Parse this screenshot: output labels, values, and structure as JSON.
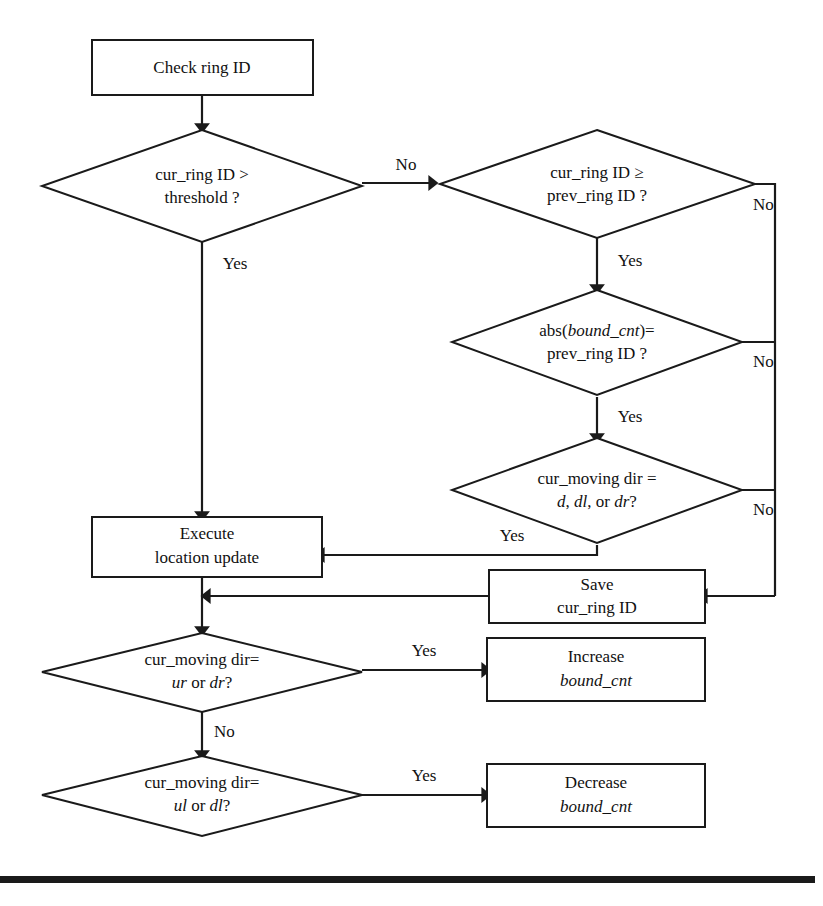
{
  "diagram": {
    "kind": "flowchart",
    "background_color": "#ffffff",
    "line_color": "#1a1a1a",
    "text_color": "#111111",
    "nodes": {
      "check_ring_id": {
        "type": "process",
        "line1": "Check ring ID"
      },
      "cur_ring_gt_threshold": {
        "type": "decision",
        "line1": "cur_ring ID >",
        "line2": "threshold ?"
      },
      "cur_ring_ge_prev_ring": {
        "type": "decision",
        "line1": "cur_ring ID ≥",
        "line2": "prev_ring ID ?"
      },
      "abs_bound_cnt_eq_prev": {
        "type": "decision",
        "line1_a": "abs(",
        "line1_b": "bound_cnt",
        "line1_c": ")=",
        "line2": "prev_ring ID ?"
      },
      "cur_moving_dir_d_dl_dr": {
        "type": "decision",
        "line1": "cur_moving dir =",
        "line2_a": "d",
        "line2_b": ", ",
        "line2_c": "dl",
        "line2_d": ", or ",
        "line2_e": "dr",
        "line2_f": "?"
      },
      "execute_location_update": {
        "type": "process",
        "line1": "Execute",
        "line2": "location update"
      },
      "save_cur_ring_id": {
        "type": "process",
        "line1": "Save",
        "line2": "cur_ring ID"
      },
      "cur_moving_dir_ur_dr": {
        "type": "decision",
        "line1": "cur_moving dir=",
        "line2_a": "ur",
        "line2_b": " or ",
        "line2_c": "dr",
        "line2_d": "?"
      },
      "increase_bound_cnt": {
        "type": "process",
        "line1": "Increase",
        "line2": "bound_cnt"
      },
      "cur_moving_dir_ul_dl": {
        "type": "decision",
        "line1": "cur_moving dir=",
        "line2_a": "ul",
        "line2_b": " or ",
        "line2_c": "dl",
        "line2_d": "?"
      },
      "decrease_bound_cnt": {
        "type": "process",
        "line1": "Decrease",
        "line2": "bound_cnt"
      }
    },
    "edge_labels": {
      "threshold_no": "No",
      "threshold_yes": "Yes",
      "ge_prev_no": "No",
      "ge_prev_yes": "Yes",
      "abs_no": "No",
      "abs_yes": "Yes",
      "dir_ddldr_no": "No",
      "dir_ddldr_yes": "Yes",
      "urdr_yes": "Yes",
      "urdr_no": "No",
      "uldl_yes": "Yes"
    }
  }
}
